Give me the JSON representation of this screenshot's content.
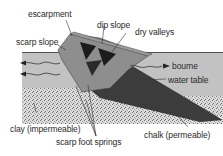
{
  "diagram": {
    "labels": {
      "escarpment": "escarpment",
      "dip_slope": "dip slope",
      "scarp_slope": "scarp slope",
      "dry_valleys": "dry valleys",
      "bourne": "bourne",
      "water_table": "water table",
      "clay": "clay (impermeable)",
      "scarp_foot_springs": "scarp foot springs",
      "chalk": "chalk (permeable)"
    },
    "colors": {
      "background": "#ffffff",
      "upper_zone": "#bdbdbd",
      "lower_zone": "#a9a9a9",
      "chalk_band": "#3c3c3c",
      "escarpment_face": "#8e8e8e",
      "dry_valley": "#1c1c1c",
      "clay_speckle": "#d8d8d8",
      "text": "#2a2a2a"
    }
  }
}
